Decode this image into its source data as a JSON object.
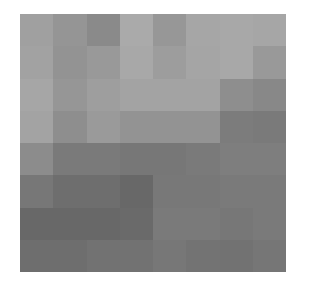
{
  "image": {
    "description": "Pixelated grayscale image composed of an 8x8 grid of gray tiles, lighter at top, darker at bottom",
    "rows": 8,
    "cols": 8,
    "pixels": [
      [
        "#a0a0a0",
        "#959595",
        "#8a8a8a",
        "#aaaaaa",
        "#979797",
        "#a6a6a6",
        "#a8a8a8",
        "#a6a6a6"
      ],
      [
        "#a2a2a2",
        "#939393",
        "#999999",
        "#a8a8a8",
        "#9d9d9d",
        "#a5a5a5",
        "#a8a8a8",
        "#999999"
      ],
      [
        "#a6a6a6",
        "#969696",
        "#9e9e9e",
        "#a3a3a3",
        "#a3a3a3",
        "#a3a3a3",
        "#8e8e8e",
        "#888888"
      ],
      [
        "#a3a3a3",
        "#8e8e8e",
        "#9a9a9a",
        "#939393",
        "#939393",
        "#939393",
        "#7c7c7c",
        "#7a7a7a"
      ],
      [
        "#8c8c8c",
        "#7a7a7a",
        "#7a7a7a",
        "#777777",
        "#777777",
        "#7a7a7a",
        "#7e7e7e",
        "#7e7e7e"
      ],
      [
        "#777777",
        "#6e6e6e",
        "#6e6e6e",
        "#686868",
        "#787878",
        "#787878",
        "#7a7a7a",
        "#7a7a7a"
      ],
      [
        "#686868",
        "#686868",
        "#686868",
        "#6a6a6a",
        "#7a7a7a",
        "#7a7a7a",
        "#777777",
        "#7a7a7a"
      ],
      [
        "#6e6e6e",
        "#6e6e6e",
        "#727272",
        "#727272",
        "#777777",
        "#737373",
        "#727272",
        "#767676"
      ]
    ]
  }
}
